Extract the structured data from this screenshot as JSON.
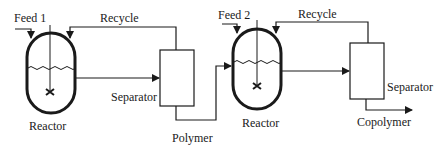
{
  "diagram": {
    "type": "process-flow",
    "stage1": {
      "feed_label": "Feed 1",
      "recycle_label": "Recycle",
      "reactor_label": "Reactor",
      "separator_label": "Separator",
      "product_label": "Polymer"
    },
    "stage2": {
      "feed_label": "Feed 2",
      "recycle_label": "Recycle",
      "reactor_label": "Reactor",
      "separator_label": "Separator",
      "product_label": "Copolymer"
    },
    "colors": {
      "line": "#1a1a1a",
      "background": "#ffffff"
    }
  }
}
